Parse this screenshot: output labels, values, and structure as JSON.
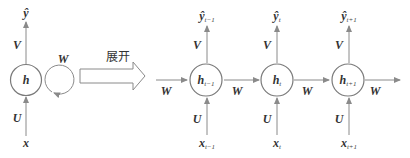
{
  "diagram": {
    "type": "rnn-unfolding",
    "colors": {
      "stroke": "#7a7a7a",
      "text": "#333333",
      "background": "#ffffff"
    },
    "folded": {
      "hidden": "h",
      "input": "x",
      "output": "ŷ",
      "input_weight": "U",
      "output_weight": "V",
      "recurrent_weight": "W"
    },
    "unfold_label": "展开",
    "unfolded": {
      "incoming_weight": "W",
      "outgoing_weight": "W",
      "steps": [
        {
          "hidden": "h",
          "hidden_sub": "t−1",
          "input": "x",
          "input_sub": "t−1",
          "output": "ŷ",
          "output_sub": "t−1",
          "U": "U",
          "V": "V",
          "W_next": "W"
        },
        {
          "hidden": "h",
          "hidden_sub": "t",
          "input": "x",
          "input_sub": "t",
          "output": "ŷ",
          "output_sub": "t",
          "U": "U",
          "V": "V",
          "W_next": "W"
        },
        {
          "hidden": "h",
          "hidden_sub": "t+1",
          "input": "x",
          "input_sub": "t+1",
          "output": "ŷ",
          "output_sub": "t+1",
          "U": "U",
          "V": "V"
        }
      ]
    }
  }
}
